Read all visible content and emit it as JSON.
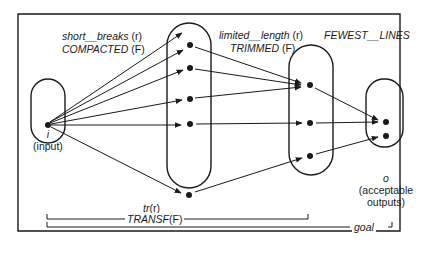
{
  "diagram": {
    "sets": {
      "input": {
        "symbol": "i",
        "label": "(input)"
      },
      "short_breaks": {
        "name": "short__breaks",
        "rel": "(r)",
        "fname": "COMPACTED",
        "frel": "(F)"
      },
      "limited_length": {
        "name": "limited__length",
        "rel": "(r)",
        "fname": "TRIMMED",
        "frel": "(F)"
      },
      "fewest_lines": {
        "fname": "FEWEST__LINES"
      },
      "outputs": {
        "symbol": "o",
        "label_line1": "(acceptable",
        "label_line2": "outputs)"
      }
    },
    "brackets": {
      "transf": {
        "upper": "tr",
        "upper_rel": "(r)",
        "lower": "TRANSF",
        "lower_rel": "(F)"
      },
      "goal": {
        "label": "goal"
      }
    },
    "colors": {
      "ink": "#1a1a1a",
      "background": "#ffffff"
    }
  }
}
